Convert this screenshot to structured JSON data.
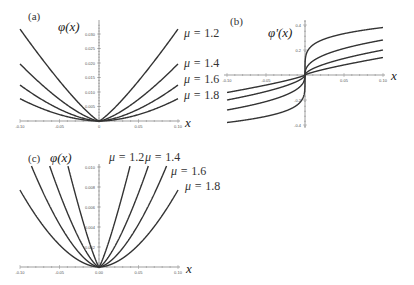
{
  "chart_data": [
    {
      "panel": "(a)",
      "type": "line",
      "title": "",
      "ylabel": "φ(x)",
      "xlabel": "x",
      "xlim": [
        -0.1,
        0.1
      ],
      "ylim": [
        0,
        0.033
      ],
      "grid": false,
      "xticks": [
        "-0.10",
        "-0.05",
        "0",
        "0.05",
        "0.10"
      ],
      "xtick_values": [
        -0.1,
        -0.05,
        0,
        0.05,
        0.1
      ],
      "yticks": [
        "0.005",
        "0.010",
        "0.015",
        "0.020",
        "0.025",
        "0.030"
      ],
      "ytick_values": [
        0.005,
        0.01,
        0.015,
        0.02,
        0.025,
        0.03
      ],
      "form": "phi",
      "series": [
        {
          "name": "μ = 1.2",
          "mu": 1.2,
          "value_at_0.10": 0.0317
        },
        {
          "name": "μ = 1.4",
          "mu": 1.4,
          "value_at_0.10": 0.0197
        },
        {
          "name": "μ = 1.6",
          "mu": 1.6,
          "value_at_0.10": 0.0124
        },
        {
          "name": "μ = 1.8",
          "mu": 1.8,
          "value_at_0.10": 0.0077
        }
      ]
    },
    {
      "panel": "(b)",
      "type": "line",
      "title": "",
      "ylabel": "φ'(x)",
      "xlabel": "x",
      "xlim": [
        -0.1,
        0.1
      ],
      "ylim": [
        -0.45,
        0.45
      ],
      "grid": false,
      "xticks": [
        "-0.10",
        "-0.05",
        "0.05",
        "0.10"
      ],
      "xtick_values": [
        -0.1,
        -0.05,
        0.05,
        0.1
      ],
      "yticks": [
        "-0.4",
        "-0.2",
        "0.2",
        "0.4"
      ],
      "ytick_values": [
        -0.4,
        -0.2,
        0.2,
        0.4
      ],
      "form": "dphi",
      "series": [
        {
          "name": "μ = 1.2",
          "mu": 1.2,
          "value_at_0.10": 0.38
        },
        {
          "name": "μ = 1.4",
          "mu": 1.4,
          "value_at_0.10": 0.28
        },
        {
          "name": "μ = 1.6",
          "mu": 1.6,
          "value_at_0.10": 0.2
        },
        {
          "name": "μ = 1.8",
          "mu": 1.8,
          "value_at_0.10": 0.14
        }
      ]
    },
    {
      "panel": "(c)",
      "type": "line",
      "title": "",
      "ylabel": "φ(x)",
      "xlabel": "x",
      "xlim": [
        -0.1,
        0.1
      ],
      "ylim": [
        0,
        0.01
      ],
      "grid": false,
      "xticks": [
        "-0.10",
        "-0.05",
        "0.00",
        "0.05",
        "0.10"
      ],
      "xtick_values": [
        -0.1,
        -0.05,
        0.0,
        0.05,
        0.1
      ],
      "yticks": [
        "0.002",
        "0.004",
        "0.006",
        "0.008",
        "0.010"
      ],
      "ytick_values": [
        0.002,
        0.004,
        0.006,
        0.008,
        0.01
      ],
      "form": "phi2",
      "series": [
        {
          "name": "μ = 1.2",
          "mu": 1.2,
          "x_at_top": 0.039
        },
        {
          "name": "μ = 1.4",
          "mu": 1.4,
          "x_at_top": 0.062
        },
        {
          "name": "μ = 1.6",
          "mu": 1.6,
          "x_at_top": 0.085
        },
        {
          "name": "μ = 1.8",
          "mu": 1.8,
          "value_at_0.10": 0.0077
        }
      ]
    }
  ],
  "labels": {
    "panel_a": "(a)",
    "panel_b": "(b)",
    "panel_c": "(c)",
    "phi": "φ(x)",
    "dphi": "φ'(x)",
    "x": "x",
    "mu_prefix": "μ = ",
    "mu_values": [
      "1.2",
      "1.4",
      "1.6",
      "1.8"
    ]
  }
}
